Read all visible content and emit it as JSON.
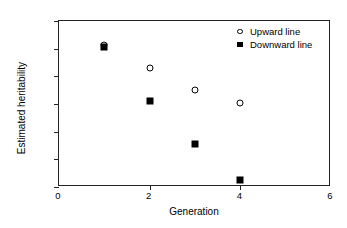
{
  "chart_data": {
    "type": "scatter",
    "title": "",
    "xlabel": "Generation",
    "ylabel": "Estimated heritability",
    "xlim": [
      0,
      6
    ],
    "ylim": [
      0,
      0.6
    ],
    "xticks": [
      "0",
      "2",
      "4",
      "6"
    ],
    "xtick_values": [
      0,
      2,
      4,
      6
    ],
    "yticks": [
      "0",
      "0.1",
      "0.2",
      "0.3",
      "0.4",
      "0.5",
      "0.6"
    ],
    "ytick_values": [
      0,
      0.1,
      0.2,
      0.3,
      0.4,
      0.5,
      0.6
    ],
    "grid": false,
    "legend_position": "top-right-inside",
    "x": [
      1,
      2,
      3,
      4
    ],
    "series": [
      {
        "name": "Upward line",
        "marker": "open-circle",
        "color": "#000000",
        "values": [
          0.515,
          0.43,
          0.35,
          0.305
        ]
      },
      {
        "name": "Downward line",
        "marker": "filled-square",
        "color": "#000000",
        "values": [
          0.505,
          0.31,
          0.155,
          0.025
        ]
      }
    ]
  }
}
